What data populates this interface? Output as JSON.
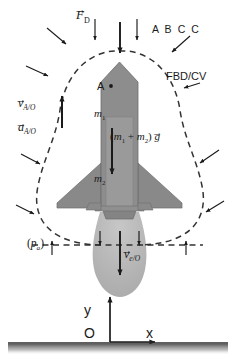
{
  "figure": {
    "background_color": "#ffffff"
  },
  "colors": {
    "ink": "#1a1a1a",
    "rocket_body": "#8d8d8d",
    "rocket_body_dark": "#7b7b7b",
    "rocket_core": "#989898",
    "plume": "#b3b3b3",
    "dashed_boundary": "#3a3a3a",
    "ground": "#2a2a2a"
  },
  "labels": {
    "drag_force": {
      "symbol": "F",
      "subscript": "D",
      "vector": true
    },
    "abcc": "A B C C",
    "fbd_cv": "FBD/CV",
    "velocity_A": {
      "symbol": "v",
      "subscript": "A/O",
      "vector": true
    },
    "acceleration_A": {
      "symbol": "a",
      "subscript": "A/O",
      "vector": true
    },
    "point_A": "A",
    "mass_1": {
      "symbol": "m",
      "subscript": "1"
    },
    "mass_2": {
      "symbol": "m",
      "subscript": "2"
    },
    "weight": {
      "text": "(m1 + m2) g",
      "vector_on": "g"
    },
    "ambient_pressure": {
      "symbol": "p",
      "subscript": "a",
      "parenthesized": true
    },
    "exhaust_velocity": {
      "symbol": "v",
      "subscript": "e/O",
      "vector": true
    },
    "axis_y": "y",
    "axis_x": "x",
    "origin": "O"
  },
  "annotations": {
    "pressure_arrow_count": 14,
    "control_volume_style": "dashed",
    "ground_style": "solid line with gradient shading"
  }
}
